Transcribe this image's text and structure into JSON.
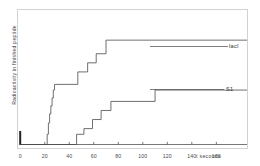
{
  "chart_data": {
    "type": "line",
    "title": "",
    "xlabel": "t  seconds",
    "ylabel": "Radioactivity in finished peptide",
    "xlim": [
      0,
      185
    ],
    "ylim": [
      0,
      1.08
    ],
    "grid": false,
    "legend_position": "inline-right",
    "xticks": [
      0,
      20,
      40,
      60,
      80,
      100,
      120,
      140,
      160
    ],
    "xtick_labels": [
      "0",
      "20",
      "40",
      "60",
      "80",
      "100",
      "120",
      "140",
      "160"
    ],
    "yticks": [],
    "ytick_labels": [],
    "series": [
      {
        "name": "lacI",
        "label": "lacI",
        "color": "#4a4a4a",
        "step": "post",
        "x": [
          0,
          21,
          22,
          23,
          24,
          25,
          26,
          27,
          28,
          40,
          47,
          55,
          62,
          70,
          185
        ],
        "y": [
          0,
          0,
          0.09,
          0.19,
          0.27,
          0.34,
          0.41,
          0.48,
          0.53,
          0.53,
          0.64,
          0.72,
          0.8,
          0.92,
          0.92
        ]
      },
      {
        "name": "S1",
        "label": "S1",
        "color": "#4a4a4a",
        "step": "post",
        "x": [
          0,
          45,
          46,
          52,
          59,
          66,
          74,
          110,
          185
        ],
        "y": [
          0,
          0,
          0.09,
          0.14,
          0.22,
          0.3,
          0.38,
          0.48,
          0.48
        ]
      }
    ],
    "baseline_marker": {
      "x": 0,
      "y_top": 0.09,
      "note": "thick tick at origin"
    }
  },
  "labels": {
    "series_lacI": "lacI",
    "series_S1": "S1",
    "x_axis_title": "t  seconds",
    "y_axis_title": "Radioactivity in finished peptide"
  }
}
